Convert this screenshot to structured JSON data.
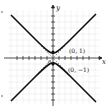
{
  "figure": {
    "type": "graph",
    "equation_description": "Hyperbola with vertical transverse axis, vertices at (0, 1) and (0, -1), dashed asymptotes y = x and y = -x",
    "axes": {
      "x_label": "x",
      "y_label": "y",
      "origin_label": "0",
      "x_range": [
        -8,
        8
      ],
      "y_range": [
        -8,
        8
      ],
      "tick_spacing": 1,
      "grid": true
    },
    "points": [
      {
        "label": "(0, 1)",
        "x": 0,
        "y": 1
      },
      {
        "label": "(0, −1)",
        "x": 0,
        "y": -1
      }
    ],
    "asymptotes": [
      "y = x",
      "y = −x"
    ],
    "colors": {
      "curve": "#111111",
      "grid": "#e4e4e4",
      "axis": "#222222",
      "asymptote": "#555555"
    }
  }
}
